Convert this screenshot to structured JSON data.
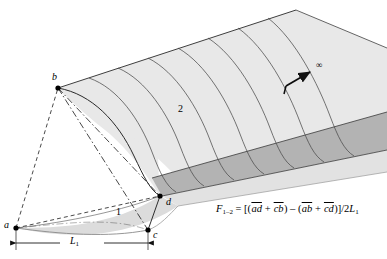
{
  "figure": {
    "type": "geometric-diagram",
    "background_color": "#ffffff",
    "surface_fill": "#e8e8e8",
    "surface_band_fill": "#b3b3b3",
    "surface_lower_fill": "#dcdcdc",
    "line_color": "#1a1a1a"
  },
  "vertices": [
    {
      "id": "a",
      "label": "a",
      "x": 16,
      "y": 228
    },
    {
      "id": "b",
      "label": "b",
      "x": 58,
      "y": 88
    },
    {
      "id": "c",
      "label": "c",
      "x": 148,
      "y": 230
    },
    {
      "id": "d",
      "label": "d",
      "x": 160,
      "y": 196
    }
  ],
  "vertex_labels": [
    {
      "text": "a",
      "x": 4,
      "y": 221
    },
    {
      "text": "b",
      "x": 52,
      "y": 74
    },
    {
      "text": "c",
      "x": 153,
      "y": 231
    },
    {
      "text": "d",
      "x": 166,
      "y": 198
    }
  ],
  "region_labels": [
    {
      "text": "1",
      "x": 116,
      "y": 209
    },
    {
      "text": "2",
      "x": 178,
      "y": 106
    }
  ],
  "infinity": {
    "symbol": "∞",
    "label_x": 317,
    "label_y": 64,
    "arrow_start_x": 286,
    "arrow_start_y": 86,
    "arrow_end_x": 312,
    "arrow_end_y": 71
  },
  "dimension": {
    "label": "L",
    "subscript": "1",
    "label_x": 72,
    "label_y": 243,
    "line_y": 243,
    "x_start": 16,
    "x_end": 148
  },
  "formula": {
    "lhs": "F",
    "lhs_sub": "1–2",
    "equals": "=",
    "full_text": "F1-2 = [(ad + cb) - (ab + cd)]/2L1",
    "terms": {
      "open": "[(",
      "t1": "ad",
      "plus1": "+",
      "t2": "cb",
      "close1": ")",
      "minus": "–",
      "open2": "(",
      "t3": "ab",
      "plus2": "+",
      "t4": "cd",
      "close2": ")]",
      "divider": "/2",
      "denom": "L",
      "denom_sub": "1"
    }
  }
}
